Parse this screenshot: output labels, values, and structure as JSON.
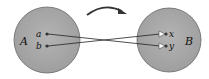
{
  "diagram": {
    "colors": {
      "set_fill": "#a9a9a9",
      "set_stroke": "#555555",
      "line": "#222222",
      "arrowhead": "#ffffff",
      "background": "#ffffff"
    },
    "sets": [
      {
        "id": "A",
        "label": "A",
        "elements": [
          {
            "id": "a",
            "label": "a"
          },
          {
            "id": "b",
            "label": "b"
          }
        ]
      },
      {
        "id": "B",
        "label": "B",
        "elements": [
          {
            "id": "x",
            "label": "x"
          },
          {
            "id": "y",
            "label": "y"
          }
        ]
      }
    ],
    "mappings": [
      {
        "from": "a",
        "to": "y"
      },
      {
        "from": "b",
        "to": "x"
      }
    ],
    "direction_arrow": "curved-arrow-right"
  }
}
